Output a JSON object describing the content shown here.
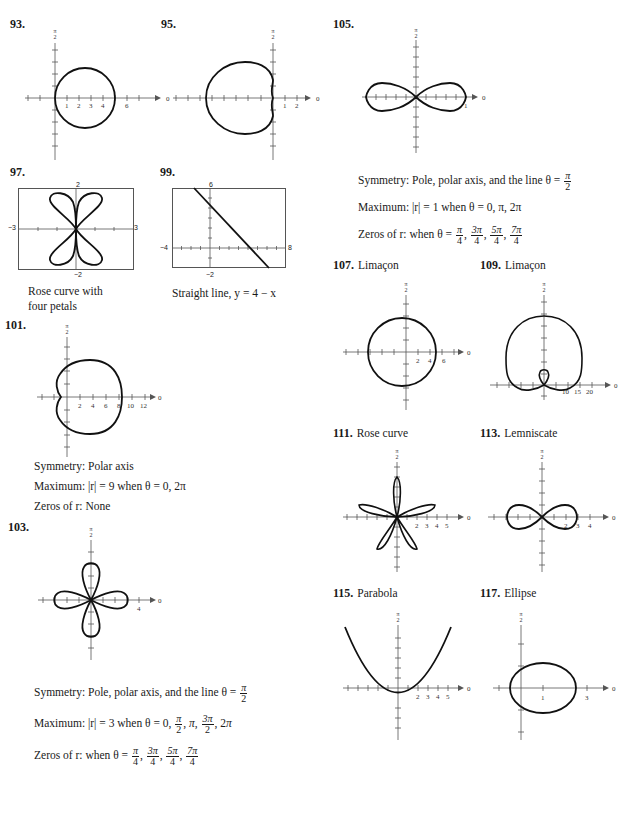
{
  "problems": {
    "p93": {
      "number": "93.",
      "axis_top": "π/2",
      "axis_right": "0",
      "ticks": [
        "1",
        "2",
        "3",
        "4",
        "6"
      ]
    },
    "p95": {
      "number": "95.",
      "axis_top": "π/2",
      "axis_right": "0",
      "ticks": [
        "1",
        "2"
      ]
    },
    "p97": {
      "number": "97.",
      "ylim_top": "2",
      "ylim_bottom": "−2",
      "xlim_left": "−3",
      "xlim_right": "3",
      "caption_line1": "Rose curve with",
      "caption_line2": "four petals"
    },
    "p99": {
      "number": "99.",
      "ylim_top": "6",
      "ylim_bottom": "−2",
      "xlim_left": "−4",
      "xlim_right": "8",
      "caption": "Straight line, y = 4 − x"
    },
    "p101": {
      "number": "101.",
      "axis_top": "π/2",
      "axis_right": "0",
      "ticks": [
        "2",
        "4",
        "6",
        "8",
        "10",
        "12"
      ],
      "symmetry": "Symmetry: Polar axis",
      "maximum": "Maximum: |r| = 9 when θ = 0, 2π",
      "zeros": "Zeros of r: None"
    },
    "p103": {
      "number": "103.",
      "axis_top": "π/2",
      "axis_right": "0",
      "ticks": [
        "4"
      ],
      "symmetry_prefix": "Symmetry: Pole, polar axis, and the line θ =",
      "symmetry_frac": {
        "num": "π",
        "den": "2"
      },
      "maximum_prefix": "Maximum: |r| = 3 when θ = 0,",
      "maximum_values": [
        "π/2",
        "π",
        "3π/2",
        "2π"
      ],
      "zeros_prefix": "Zeros of r: when θ =",
      "zeros_values": [
        "π/4",
        "3π/4",
        "5π/4",
        "7π/4"
      ]
    },
    "p105": {
      "number": "105.",
      "axis_top": "π/2",
      "axis_right": "0",
      "ticks": [
        "1"
      ],
      "symmetry_prefix": "Symmetry: Pole, polar axis, and the line θ =",
      "symmetry_frac": {
        "num": "π",
        "den": "2"
      },
      "maximum": "Maximum: |r| = 1 when θ = 0, π, 2π",
      "zeros_prefix": "Zeros of r: when θ =",
      "zeros_values": [
        "π/4",
        "3π/4",
        "5π/4",
        "7π/4"
      ]
    },
    "p107": {
      "number": "107.",
      "label": "Limaçon",
      "axis_top": "π/2",
      "axis_right": "0",
      "ticks": [
        "2",
        "4",
        "6"
      ]
    },
    "p109": {
      "number": "109.",
      "label": "Limaçon",
      "axis_top": "π/2",
      "axis_right": "0",
      "ticks": [
        "10",
        "15",
        "20"
      ]
    },
    "p111": {
      "number": "111.",
      "label": "Rose curve",
      "axis_top": "π/2",
      "axis_right": "0",
      "ticks": [
        "2",
        "3",
        "4",
        "5"
      ]
    },
    "p113": {
      "number": "113.",
      "label": "Lemniscate",
      "axis_top": "π/2",
      "axis_right": "0",
      "ticks": [
        "2",
        "3",
        "4"
      ]
    },
    "p115": {
      "number": "115.",
      "label": "Parabola",
      "axis_top": "π/2",
      "axis_right": "0",
      "ticks": [
        "2",
        "3",
        "4",
        "5"
      ]
    },
    "p117": {
      "number": "117.",
      "label": "Ellipse",
      "axis_top": "π/2",
      "axis_right": "0",
      "ticks": [
        "1",
        "3"
      ]
    }
  }
}
